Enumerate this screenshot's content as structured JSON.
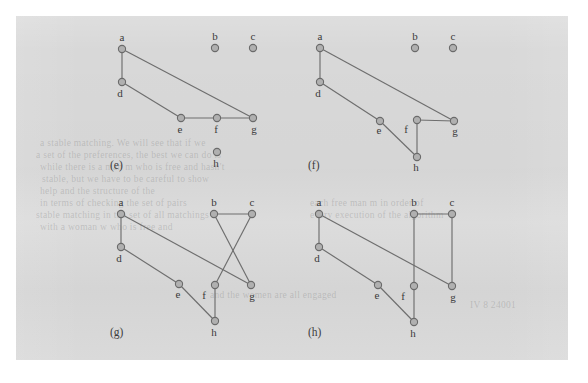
{
  "figure": {
    "caption_style": "parenthesized-letter",
    "background_color": "#d8d8d8",
    "page_color": "#ffffff",
    "node_fill": "#b0b0b0",
    "node_stroke": "#6a6a6a",
    "edge_color": "#6e6e6e"
  },
  "bleed_text": [
    {
      "text": "a stable matching. We will see that if we",
      "x": 40,
      "y": 138
    },
    {
      "text": "a set of the preferences, the best we can do is",
      "x": 36,
      "y": 150
    },
    {
      "text": "while there is a man m who is free and hasn't",
      "x": 40,
      "y": 162
    },
    {
      "text": "stable, but we have to be careful to show",
      "x": 42,
      "y": 174
    },
    {
      "text": "help and the structure of the",
      "x": 40,
      "y": 186
    },
    {
      "text": "in terms of checking the set of pairs",
      "x": 40,
      "y": 198
    },
    {
      "text": "stable matching in the set of all matchings",
      "x": 36,
      "y": 210
    },
    {
      "text": "with a woman w who is free and",
      "x": 40,
      "y": 222
    },
    {
      "text": "each free man m in order of",
      "x": 310,
      "y": 198
    },
    {
      "text": "every execution of the algorithm",
      "x": 310,
      "y": 210
    },
    {
      "text": "and the women are all engaged",
      "x": 210,
      "y": 290
    },
    {
      "text": "IV 8 24001",
      "x": 470,
      "y": 300
    }
  ],
  "panels": [
    {
      "id": "e",
      "label": "(e)",
      "label_pos": {
        "x": 110,
        "y": 159
      },
      "origin": {
        "x": 0,
        "y": 0
      },
      "nodes": [
        {
          "id": "a",
          "x": 122,
          "y": 49,
          "label": "a",
          "lx": 122,
          "ly": 41
        },
        {
          "id": "b",
          "x": 215,
          "y": 48,
          "label": "b",
          "lx": 215,
          "ly": 40
        },
        {
          "id": "c",
          "x": 253,
          "y": 48,
          "label": "c",
          "lx": 253,
          "ly": 40
        },
        {
          "id": "d",
          "x": 122,
          "y": 82,
          "label": "d",
          "lx": 120,
          "ly": 97
        },
        {
          "id": "e",
          "x": 181,
          "y": 118,
          "label": "e",
          "lx": 180,
          "ly": 133
        },
        {
          "id": "f",
          "x": 217,
          "y": 118,
          "label": "f",
          "lx": 216,
          "ly": 133
        },
        {
          "id": "g",
          "x": 253,
          "y": 118,
          "label": "g",
          "lx": 254,
          "ly": 133
        },
        {
          "id": "h",
          "x": 217,
          "y": 152,
          "label": "h",
          "lx": 216,
          "ly": 167
        }
      ],
      "edges": [
        {
          "from": "a",
          "to": "d"
        },
        {
          "from": "a",
          "to": "g"
        },
        {
          "from": "d",
          "to": "e"
        },
        {
          "from": "e",
          "to": "f"
        },
        {
          "from": "f",
          "to": "g"
        }
      ]
    },
    {
      "id": "f",
      "label": "(f)",
      "label_pos": {
        "x": 308,
        "y": 159
      },
      "origin": {
        "x": 0,
        "y": 0
      },
      "nodes": [
        {
          "id": "a",
          "x": 320,
          "y": 48,
          "label": "a",
          "lx": 320,
          "ly": 40
        },
        {
          "id": "b",
          "x": 415,
          "y": 48,
          "label": "b",
          "lx": 415,
          "ly": 40
        },
        {
          "id": "c",
          "x": 453,
          "y": 48,
          "label": "c",
          "lx": 453,
          "ly": 40
        },
        {
          "id": "d",
          "x": 320,
          "y": 82,
          "label": "d",
          "lx": 318,
          "ly": 97
        },
        {
          "id": "e",
          "x": 380,
          "y": 121,
          "label": "e",
          "lx": 379,
          "ly": 134
        },
        {
          "id": "f",
          "x": 417,
          "y": 120,
          "label": "f",
          "lx": 406,
          "ly": 133
        },
        {
          "id": "g",
          "x": 454,
          "y": 121,
          "label": "g",
          "lx": 455,
          "ly": 135
        },
        {
          "id": "h",
          "x": 417,
          "y": 157,
          "label": "h",
          "lx": 416,
          "ly": 171
        }
      ],
      "edges": [
        {
          "from": "a",
          "to": "d"
        },
        {
          "from": "a",
          "to": "g"
        },
        {
          "from": "d",
          "to": "e"
        },
        {
          "from": "e",
          "to": "h"
        },
        {
          "from": "f",
          "to": "h"
        },
        {
          "from": "f",
          "to": "g"
        }
      ]
    },
    {
      "id": "g",
      "label": "(g)",
      "label_pos": {
        "x": 110,
        "y": 326
      },
      "origin": {
        "x": 0,
        "y": 0
      },
      "nodes": [
        {
          "id": "a",
          "x": 121,
          "y": 214,
          "label": "a",
          "lx": 121,
          "ly": 206
        },
        {
          "id": "b",
          "x": 214,
          "y": 214,
          "label": "b",
          "lx": 214,
          "ly": 206
        },
        {
          "id": "c",
          "x": 252,
          "y": 214,
          "label": "c",
          "lx": 252,
          "ly": 206
        },
        {
          "id": "d",
          "x": 121,
          "y": 247,
          "label": "d",
          "lx": 119,
          "ly": 262
        },
        {
          "id": "e",
          "x": 179,
          "y": 284,
          "label": "e",
          "lx": 178,
          "ly": 298
        },
        {
          "id": "f",
          "x": 215,
          "y": 285,
          "label": "f",
          "lx": 204,
          "ly": 299
        },
        {
          "id": "g",
          "x": 251,
          "y": 285,
          "label": "g",
          "lx": 252,
          "ly": 300
        },
        {
          "id": "h",
          "x": 215,
          "y": 321,
          "label": "h",
          "lx": 214,
          "ly": 336
        }
      ],
      "edges": [
        {
          "from": "a",
          "to": "d"
        },
        {
          "from": "a",
          "to": "g"
        },
        {
          "from": "d",
          "to": "e"
        },
        {
          "from": "e",
          "to": "h"
        },
        {
          "from": "f",
          "to": "h"
        },
        {
          "from": "b",
          "to": "c"
        },
        {
          "from": "b",
          "to": "g"
        },
        {
          "from": "c",
          "to": "f"
        }
      ]
    },
    {
      "id": "h",
      "label": "(h)",
      "label_pos": {
        "x": 308,
        "y": 326
      },
      "origin": {
        "x": 0,
        "y": 0
      },
      "nodes": [
        {
          "id": "a",
          "x": 319,
          "y": 214,
          "label": "a",
          "lx": 319,
          "ly": 206
        },
        {
          "id": "b",
          "x": 414,
          "y": 214,
          "label": "b",
          "lx": 414,
          "ly": 206
        },
        {
          "id": "c",
          "x": 452,
          "y": 214,
          "label": "c",
          "lx": 452,
          "ly": 206
        },
        {
          "id": "d",
          "x": 319,
          "y": 247,
          "label": "d",
          "lx": 317,
          "ly": 262
        },
        {
          "id": "e",
          "x": 378,
          "y": 285,
          "label": "e",
          "lx": 377,
          "ly": 299
        },
        {
          "id": "f",
          "x": 414,
          "y": 286,
          "label": "f",
          "lx": 403,
          "ly": 300
        },
        {
          "id": "g",
          "x": 452,
          "y": 286,
          "label": "g",
          "lx": 453,
          "ly": 301
        },
        {
          "id": "h",
          "x": 414,
          "y": 322,
          "label": "h",
          "lx": 413,
          "ly": 337
        }
      ],
      "edges": [
        {
          "from": "a",
          "to": "d"
        },
        {
          "from": "a",
          "to": "g"
        },
        {
          "from": "d",
          "to": "e"
        },
        {
          "from": "e",
          "to": "h"
        },
        {
          "from": "f",
          "to": "h"
        },
        {
          "from": "b",
          "to": "c"
        },
        {
          "from": "b",
          "to": "f"
        },
        {
          "from": "c",
          "to": "g"
        }
      ]
    }
  ]
}
